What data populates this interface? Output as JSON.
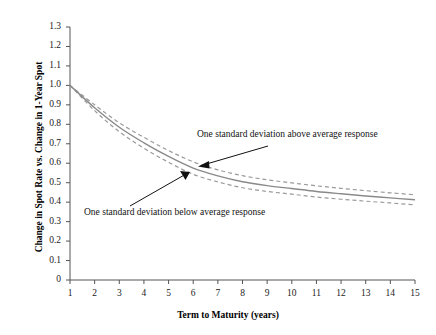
{
  "chart_data": {
    "type": "line",
    "title": "",
    "subtitle": "",
    "xlabel": "Term to Maturity (years)",
    "ylabel": "Change in Spot Rate vs. Change in 1-Year Spot",
    "xlim": [
      1,
      15
    ],
    "ylim": [
      0,
      1.3
    ],
    "grid": false,
    "legend_position": "none",
    "x_ticks": [
      "1",
      "2",
      "3",
      "4",
      "5",
      "6",
      "7",
      "8",
      "9",
      "10",
      "11",
      "12",
      "13",
      "14",
      "15"
    ],
    "y_ticks": [
      "0",
      "0.1",
      "0.2",
      "0.3",
      "0.4",
      "0.5",
      "0.6",
      "0.7",
      "0.8",
      "0.9",
      "1.0",
      "1.1",
      "1.2",
      "1.3"
    ],
    "x": [
      1,
      2,
      3,
      4,
      5,
      6,
      7,
      8,
      9,
      10,
      11,
      12,
      13,
      14,
      15
    ],
    "series": [
      {
        "name": "Average response",
        "style": "solid",
        "color": "#8a8a8a",
        "values": [
          1.0,
          0.885,
          0.785,
          0.705,
          0.635,
          0.575,
          0.535,
          0.505,
          0.485,
          0.47,
          0.455,
          0.443,
          0.432,
          0.422,
          0.412
        ]
      },
      {
        "name": "One standard deviation above average response",
        "style": "dashed",
        "color": "#9a9a9a",
        "values": [
          1.0,
          0.9,
          0.808,
          0.733,
          0.665,
          0.607,
          0.566,
          0.536,
          0.515,
          0.499,
          0.484,
          0.471,
          0.459,
          0.448,
          0.438
        ]
      },
      {
        "name": "One standard deviation below average response",
        "style": "dashed",
        "color": "#9a9a9a",
        "values": [
          1.0,
          0.87,
          0.762,
          0.677,
          0.605,
          0.543,
          0.504,
          0.474,
          0.455,
          0.441,
          0.426,
          0.415,
          0.405,
          0.396,
          0.386
        ]
      }
    ],
    "annotations": [
      {
        "id": "above",
        "text": "One standard deviation above average response",
        "points_to_x": 6.3,
        "points_to_y": 0.575
      },
      {
        "id": "below",
        "text": "One standard deviation below average response",
        "points_to_x": 6.0,
        "points_to_y": 0.525
      }
    ]
  },
  "axes": {
    "y_title": "Change in Spot Rate vs. Change in 1-Year Spot",
    "x_title": "Term to Maturity (years)"
  },
  "colors": {
    "axis": "#555555",
    "mean_line": "#8a8a8a",
    "band_line": "#9a9a9a",
    "annotation": "#111111",
    "background": "#ffffff"
  }
}
